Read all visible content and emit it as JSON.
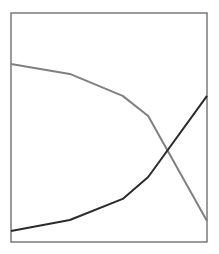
{
  "chart_data": {
    "type": "line",
    "title": "",
    "xlabel": "",
    "ylabel": "",
    "x": [
      0.0,
      0.3,
      0.57,
      0.7,
      1.0
    ],
    "xlim": [
      0,
      1
    ],
    "ylim": [
      0,
      100
    ],
    "grid": false,
    "legend": null,
    "series": [
      {
        "name": "decreasing",
        "color": "#808080",
        "values": [
          77.7,
          73.4,
          63.8,
          55.0,
          9.2
        ]
      },
      {
        "name": "increasing",
        "color": "#2b2b2b",
        "values": [
          4.8,
          9.6,
          18.8,
          28.4,
          63.8
        ]
      }
    ]
  },
  "frame": {
    "left": 11,
    "top": 13,
    "right": 207,
    "bottom": 242,
    "color": "#666666"
  }
}
